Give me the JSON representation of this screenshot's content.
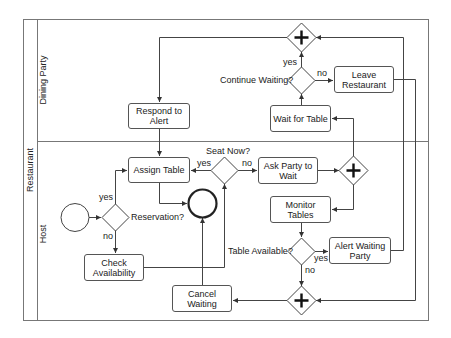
{
  "pool": {
    "label": "Restaurant"
  },
  "lanes": [
    {
      "id": "dining-party",
      "label": "Dining Party"
    },
    {
      "id": "host",
      "label": "Host"
    }
  ],
  "tasks": {
    "respond_to_alert": "Respond to Alert",
    "assign_table": "Assign Table",
    "check_availability": "Check Availability",
    "ask_party_to_wait": "Ask Party to Wait",
    "monitor_tables": "Monitor Tables",
    "alert_waiting_party": "Alert Waiting Party",
    "cancel_waiting": "Cancel Waiting",
    "wait_for_table": "Wait for Table",
    "leave_restaurant": "Leave Restaurant"
  },
  "gateways": {
    "reservation": "Reservation?",
    "seat_now": "Seat Now?",
    "table_available": "Table Available?",
    "continue_waiting": "Continue Waiting?"
  },
  "flow_labels": {
    "reservation_yes": "yes",
    "reservation_no": "no",
    "seat_now_yes": "yes",
    "seat_now_no": "no",
    "table_available_yes": "yes",
    "table_available_no": "no",
    "continue_waiting_yes": "yes",
    "continue_waiting_no": "no"
  },
  "colors": {
    "line": "#444444",
    "border": "#555555",
    "background": "#ffffff"
  }
}
